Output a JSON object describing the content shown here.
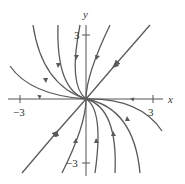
{
  "figure": {
    "type": "phase-portrait",
    "colors": {
      "curve": "#5a5a5a",
      "axis": "#555555",
      "text": "#333333"
    },
    "axes": {
      "x_label": "x",
      "y_label": "y",
      "x_ticks": [
        {
          "value": -3,
          "label": "−3"
        },
        {
          "value": 3,
          "label": "3"
        }
      ],
      "y_ticks": [
        {
          "value": 3,
          "label": "3"
        },
        {
          "value": -3,
          "label": "−3"
        }
      ]
    }
  }
}
